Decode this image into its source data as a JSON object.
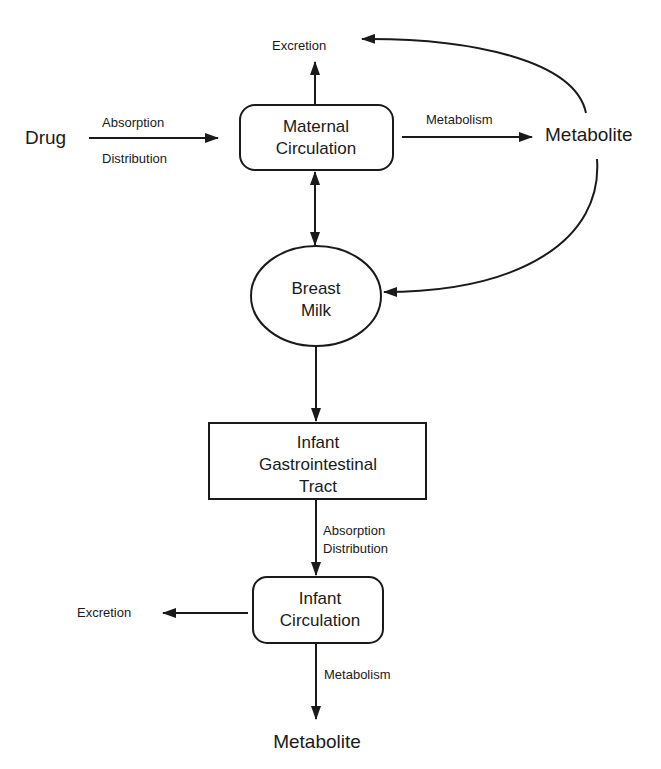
{
  "diagram": {
    "nodes": {
      "drug": "Drug",
      "maternal_circulation": [
        "Maternal",
        "Circulation"
      ],
      "maternal_excretion": "Excretion",
      "maternal_metabolite": "Metabolite",
      "breast_milk": [
        "Breast",
        "Milk"
      ],
      "infant_gi_tract": [
        "Infant",
        "Gastrointestinal",
        "Tract"
      ],
      "infant_circulation": [
        "Infant",
        "Circulation"
      ],
      "infant_excretion": "Excretion",
      "infant_metabolite": "Metabolite"
    },
    "edge_labels": {
      "drug_to_maternal_top": "Absorption",
      "drug_to_maternal_bottom": "Distribution",
      "maternal_to_metabolite": "Metabolism",
      "gi_to_infant_line1": "Absorption",
      "gi_to_infant_line2": "Distribution",
      "infant_to_metabolite": "Metabolism"
    },
    "edges": [
      {
        "from": "Drug",
        "to": "Maternal Circulation",
        "label": "Absorption / Distribution"
      },
      {
        "from": "Maternal Circulation",
        "to": "Excretion"
      },
      {
        "from": "Maternal Circulation",
        "to": "Metabolite",
        "label": "Metabolism"
      },
      {
        "from": "Metabolite",
        "to": "Excretion"
      },
      {
        "from": "Metabolite",
        "to": "Breast Milk"
      },
      {
        "from": "Maternal Circulation",
        "to": "Breast Milk",
        "bidirectional": true
      },
      {
        "from": "Breast Milk",
        "to": "Infant Gastrointestinal Tract"
      },
      {
        "from": "Infant Gastrointestinal Tract",
        "to": "Infant Circulation",
        "label": "Absorption / Distribution"
      },
      {
        "from": "Infant Circulation",
        "to": "Excretion"
      },
      {
        "from": "Infant Circulation",
        "to": "Metabolite",
        "label": "Metabolism"
      }
    ]
  }
}
